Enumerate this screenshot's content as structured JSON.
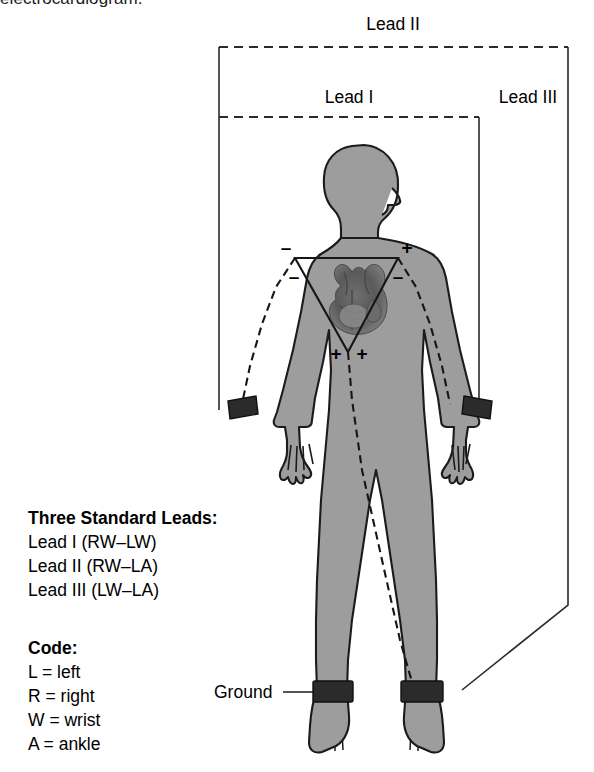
{
  "caption": {
    "clipped_text": "electrocardiogram."
  },
  "brackets": {
    "lead_ii": "Lead II",
    "lead_i": "Lead I",
    "lead_iii": "Lead III"
  },
  "annotations": {
    "ground": "Ground"
  },
  "polarity_marks": {
    "left_shoulder_outer": "–",
    "left_shoulder_inner": "–",
    "right_shoulder_outer": "+",
    "right_shoulder_inner": "–",
    "apex_left": "+",
    "apex_right": "+"
  },
  "legend_leads": {
    "title": "Three Standard Leads:",
    "items": [
      "Lead I (RW–LW)",
      "Lead II (RW–LA)",
      "Lead III (LW–LA)"
    ]
  },
  "legend_code": {
    "title": "Code:",
    "items": [
      "L = left",
      "R = right",
      "W = wrist",
      "A = ankle"
    ]
  },
  "colors": {
    "body_fill": "#9d9d9d",
    "body_outline": "#1b1b1b",
    "electrode_band": "#2b2b2b",
    "line": "#2a2a2a",
    "background": "#ffffff"
  },
  "electrodes": [
    {
      "name": "right-wrist-electrode",
      "side": "left-of-image",
      "site": "wrist"
    },
    {
      "name": "left-wrist-electrode",
      "side": "right-of-image",
      "site": "wrist"
    },
    {
      "name": "right-ankle-electrode",
      "side": "left-of-image",
      "site": "ankle"
    },
    {
      "name": "left-ankle-electrode",
      "side": "right-of-image",
      "site": "ankle"
    }
  ]
}
